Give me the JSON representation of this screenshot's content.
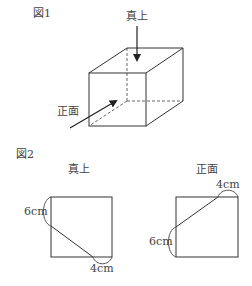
{
  "figure1": {
    "title": "図1",
    "top_label": "真上",
    "front_label": "正面"
  },
  "figure2": {
    "title": "図2",
    "top_view": {
      "label": "真上",
      "side_measure": "6cm",
      "bottom_measure": "4cm"
    },
    "front_view": {
      "label": "正面",
      "top_measure": "4cm",
      "side_measure": "6cm"
    }
  },
  "colors": {
    "line": "#333333",
    "background": "#ffffff"
  }
}
